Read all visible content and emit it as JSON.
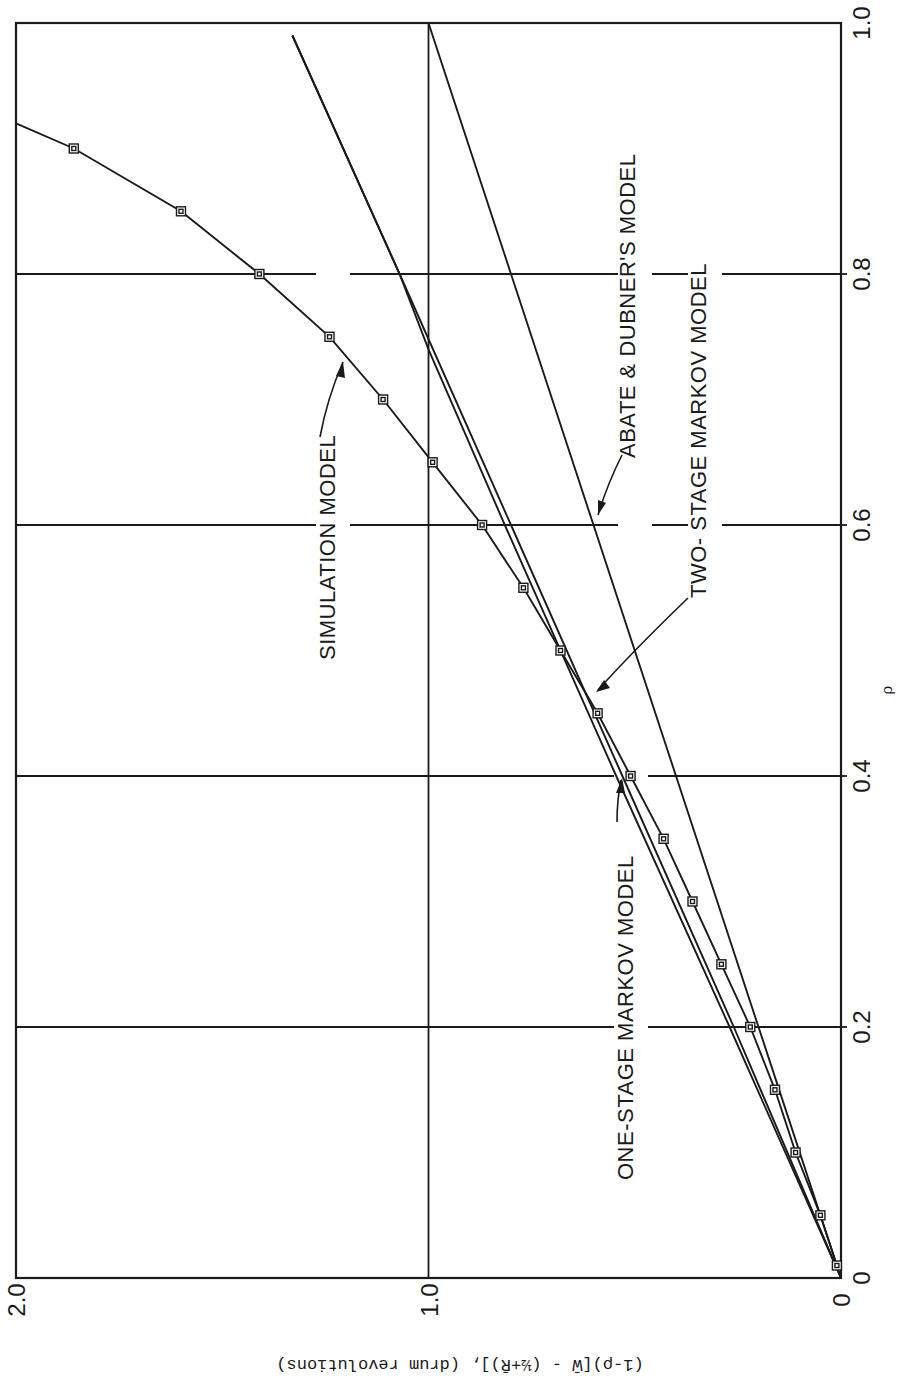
{
  "chart_data": {
    "type": "line",
    "orientation": "rotated 90 degrees counter-clockwise (x-axis runs along right edge bottom-to-top, y-axis along bottom edge right-to-left; y-axis label printed upside down)",
    "title": "",
    "xlabel": "ρ",
    "ylabel": "(1-ρ)[W̄ - (½+R̄)], (drum revolutions)",
    "xlim": [
      0,
      1.0
    ],
    "ylim": [
      0,
      2.0
    ],
    "x_ticks": [
      "0",
      "0.2",
      "0.4",
      "0.6",
      "0.8",
      "1.0"
    ],
    "y_ticks": [
      "0",
      "1.0",
      "2.0"
    ],
    "grid": true,
    "series": [
      {
        "name": "SIMULATION MODEL",
        "marker": "square",
        "x": [
          0.01,
          0.05,
          0.1,
          0.15,
          0.2,
          0.25,
          0.3,
          0.35,
          0.4,
          0.45,
          0.5,
          0.55,
          0.6,
          0.65,
          0.7,
          0.75,
          0.8,
          0.85,
          0.9,
          0.92
        ],
        "y": [
          0.01,
          0.05,
          0.11,
          0.16,
          0.22,
          0.29,
          0.36,
          0.43,
          0.51,
          0.59,
          0.68,
          0.77,
          0.87,
          0.99,
          1.11,
          1.24,
          1.41,
          1.6,
          1.86,
          2.0
        ]
      },
      {
        "name": "ONE-STAGE MARKOV MODEL",
        "marker": "none",
        "x": [
          0,
          0.2,
          0.4,
          0.6,
          0.8,
          0.99
        ],
        "y": [
          0,
          0.26,
          0.53,
          0.8,
          1.07,
          1.33
        ]
      },
      {
        "name": "TWO-STAGE MARKOV MODEL",
        "marker": "none",
        "x": [
          0,
          0.2,
          0.4,
          0.6,
          0.74,
          0.8,
          0.99
        ],
        "y": [
          0,
          0.27,
          0.545,
          0.815,
          1.0,
          1.07,
          1.33
        ]
      },
      {
        "name": "ABATE & DUBNER'S MODEL",
        "marker": "none",
        "x": [
          0,
          0.2,
          0.4,
          0.6,
          0.8,
          1.0
        ],
        "y": [
          0,
          0.2,
          0.4,
          0.6,
          0.8,
          1.0
        ]
      }
    ],
    "annotations": [
      "SIMULATION MODEL",
      "ONE-STAGE MARKOV MODEL",
      "TWO- STAGE MARKOV MODEL",
      "ABATE & DUBNER'S MODEL"
    ]
  },
  "labels": {
    "x_axis": "ρ",
    "y_axis": "(1-ρ)[W̄ - (½+R̄)], (drum revolutions)",
    "x_ticks": [
      "0",
      "0.2",
      "0.4",
      "0.6",
      "0.8",
      "1.0"
    ],
    "y_ticks": [
      "0",
      "1.0",
      "2.0"
    ],
    "simulation": "SIMULATION  MODEL",
    "one_stage": "ONE-STAGE  MARKOV  MODEL",
    "two_stage": "TWO- STAGE  MARKOV  MODEL",
    "abate": "ABATE  &  DUBNER'S  MODEL"
  }
}
